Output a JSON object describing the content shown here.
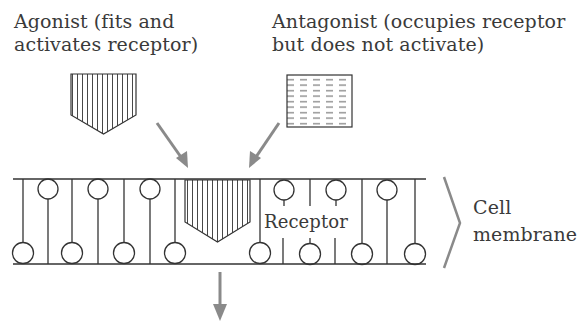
{
  "labels": {
    "agonist_line1": "Agonist (fits and",
    "agonist_line2": "activates receptor)",
    "antagonist_line1": "Antagonist (occupies receptor",
    "antagonist_line2": "but does not activate)",
    "receptor": "Receptor",
    "membrane_line1": "Cell",
    "membrane_line2": "membrane"
  },
  "colors": {
    "line": "#333333",
    "arrow": "#8a8a8a",
    "text": "#3a3a3a",
    "background": "#ffffff"
  },
  "icons": {
    "agonist": "vertical-hatched-pentagon",
    "antagonist": "dashed-hatched-rectangle",
    "arrow": "gray-arrow",
    "bracket": "right-angle-bracket"
  }
}
